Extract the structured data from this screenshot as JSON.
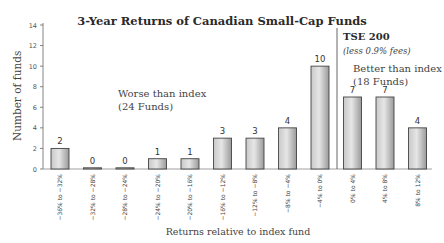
{
  "chart_data": {
    "type": "bar",
    "title": "3-Year Returns of Canadian Small-Cap Funds",
    "xlabel": "Returns relative to index fund",
    "ylabel": "Number of funds",
    "ylim": [
      0,
      14
    ],
    "yticks": [
      0,
      2,
      4,
      6,
      8,
      10,
      12,
      14
    ],
    "grid": false,
    "categories": [
      "−36% to −32%",
      "−32% to −28%",
      "−28% to −24%",
      "−24% to −20%",
      "−20% to −16%",
      "−16% to −12%",
      "−12% to −8%",
      "−8% to −4%",
      "−4% to 0%",
      "0% to 4%",
      "4% to 8%",
      "8% to 12%"
    ],
    "values": [
      2,
      0,
      0,
      1,
      1,
      3,
      3,
      4,
      10,
      7,
      7,
      4
    ],
    "annotations": {
      "worse_line1": "Worse than index",
      "worse_line2": "(24 Funds)",
      "index_label": "TSE 200",
      "index_sublabel": "(less 0.9% fees)",
      "better_line1": "Better than index",
      "better_line2": "(18 Funds)"
    }
  }
}
